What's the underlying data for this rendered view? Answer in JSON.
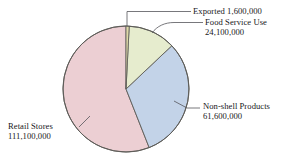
{
  "chart_data": {
    "type": "pie",
    "title": "",
    "subtitle": "",
    "xlabel": "",
    "ylabel": "",
    "legend_position": "callout-labels",
    "grid": false,
    "total": 198400000,
    "start_angle_deg": 0,
    "direction": "clockwise",
    "categories": [
      "Exported",
      "Food Service Use",
      "Non-shell Products",
      "Retail Stores"
    ],
    "values": [
      1600000,
      24100000,
      61600000,
      111100000
    ],
    "value_labels": [
      "1,600,000",
      "24,100,000",
      "61,600,000",
      "111,100,000"
    ],
    "percentages": [
      0.81,
      12.15,
      31.05,
      56.0
    ],
    "colors": [
      "#ded9a8",
      "#e6ecce",
      "#c3d3e8",
      "#eccfd3"
    ],
    "slices": [
      {
        "name": "Exported",
        "label": "Exported",
        "value_label": "1,600,000",
        "value": 1600000,
        "percent": 0.81,
        "color": "#ded9a8"
      },
      {
        "name": "Food Service Use",
        "label": "Food Service Use",
        "value_label": "24,100,000",
        "value": 24100000,
        "percent": 12.15,
        "color": "#e6ecce"
      },
      {
        "name": "Non-shell Products",
        "label": "Non-shell Products",
        "value_label": "61,600,000",
        "value": 61600000,
        "percent": 31.05,
        "color": "#c3d3e8"
      },
      {
        "name": "Retail Stores",
        "label": "Retail Stores",
        "value_label": "111,100,000",
        "value": 111100000,
        "percent": 56.0,
        "color": "#eccfd3"
      }
    ]
  },
  "labels": {
    "exported": {
      "name": "Exported",
      "value": "1,600,000",
      "combined": "Exported  1,600,000"
    },
    "food_service": {
      "name": "Food Service Use",
      "value": "24,100,000"
    },
    "nonshell": {
      "name": "Non-shell Products",
      "value": "61,600,000"
    },
    "retail": {
      "name": "Retail Stores",
      "value": "111,100,000"
    }
  },
  "style": {
    "background": "#ffffff",
    "outline": "#5d5c58",
    "leader_line": "#55555a",
    "text": "#17171a"
  }
}
